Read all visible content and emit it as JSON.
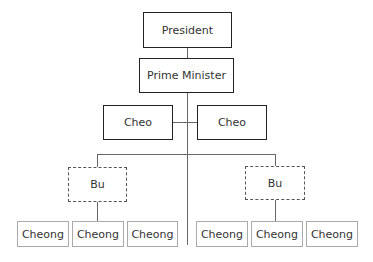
{
  "chart": {
    "president": "President",
    "prime_minister": "Prime Minister",
    "cheo": [
      "Cheo",
      "Cheo"
    ],
    "bu": [
      "Bu",
      "Bu"
    ],
    "cheong_left": [
      "Cheong",
      "Cheong",
      "Cheong"
    ],
    "cheong_right": [
      "Cheong",
      "Cheong",
      "Cheong"
    ]
  }
}
